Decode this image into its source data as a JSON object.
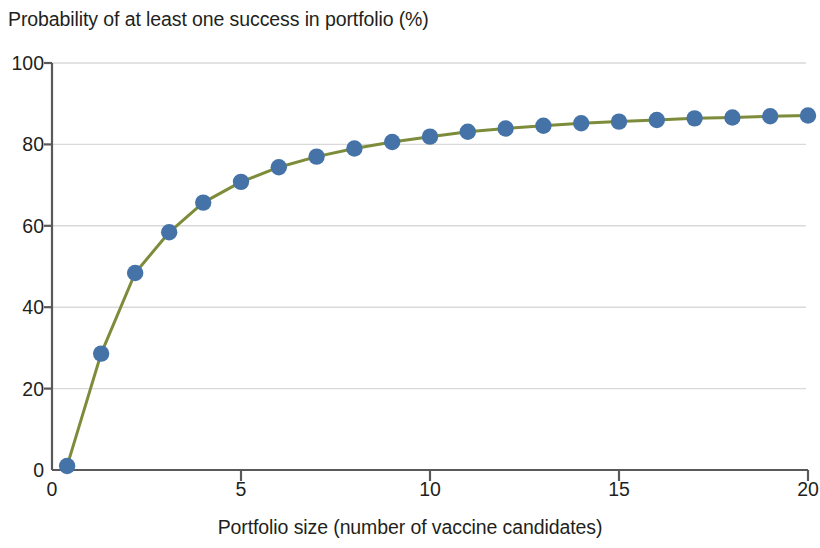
{
  "chart_data": {
    "type": "line",
    "title": "Probability of at least one success in portfolio (%)",
    "xlabel": "Portfolio size (number of vaccine candidates)",
    "ylabel": "",
    "xlim": [
      0,
      20
    ],
    "ylim": [
      0,
      100
    ],
    "xticks": [
      "0",
      "5",
      "10",
      "15",
      "20"
    ],
    "xtick_values": [
      0,
      5,
      10,
      15,
      20
    ],
    "yticks": [
      "0",
      "20",
      "40",
      "60",
      "80",
      "100"
    ],
    "ytick_values": [
      0,
      20,
      40,
      60,
      80,
      100
    ],
    "grid": "horizontal",
    "legend": "none",
    "line_color": "#7d8c3a",
    "marker_color": "#4573a7",
    "axis_color": "#58595b",
    "grid_color": "#d9d9d9",
    "x": [
      0.4,
      1.3,
      2.2,
      3.1,
      4.0,
      5.0,
      6.0,
      7.0,
      8.0,
      9.0,
      10.0,
      11.0,
      12.0,
      13.0,
      14.0,
      15.0,
      16.0,
      17.0,
      18.0,
      19.0,
      20.0
    ],
    "values": [
      1.0,
      28.6,
      48.4,
      58.4,
      65.7,
      70.8,
      74.4,
      77.0,
      79.0,
      80.6,
      81.9,
      83.1,
      83.9,
      84.6,
      85.2,
      85.6,
      86.0,
      86.4,
      86.6,
      86.9,
      87.1
    ]
  }
}
